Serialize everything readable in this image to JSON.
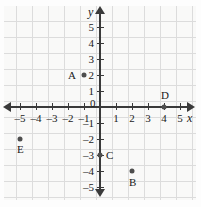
{
  "chart_data": {
    "type": "scatter",
    "title": "",
    "xlabel": "x",
    "ylabel": "y",
    "xlim": [
      -5,
      5
    ],
    "ylim": [
      -5,
      5
    ],
    "grid": true,
    "legend": "none",
    "x_ticks": [
      "-5",
      "-4",
      "-3",
      "-2",
      "-1",
      "0",
      "1",
      "2",
      "3",
      "4",
      "5"
    ],
    "y_ticks": [
      "5",
      "4",
      "3",
      "2",
      "1",
      "-1",
      "-2",
      "-3",
      "-4",
      "-5"
    ],
    "origin_label": "0",
    "points": [
      {
        "label": "A",
        "x": -1,
        "y": 2
      },
      {
        "label": "B",
        "x": 2,
        "y": -4
      },
      {
        "label": "C",
        "x": 0,
        "y": -3
      },
      {
        "label": "D",
        "x": 4,
        "y": 0
      },
      {
        "label": "E",
        "x": -5,
        "y": -2
      }
    ],
    "colors": {
      "point": "#4d4d4d",
      "axis": "#3a3a3a",
      "grid": "#cfcfcf",
      "background": "#f7f7f6",
      "text": "#1a1a1a"
    }
  }
}
